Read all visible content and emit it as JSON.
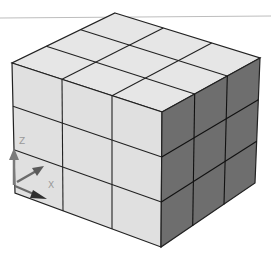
{
  "scene": {
    "description": "Isometric 3x3x3 grid of cubes in a CAD viewport",
    "grid": {
      "cols": 3,
      "rows": 3,
      "layers": 3
    },
    "colors": {
      "background": "#ffffff",
      "top_face": "#e6e6e6",
      "left_face": "#e0e0e0",
      "right_face": "#6e6e6e",
      "edge": "#222222",
      "viewport_line": "#bdbdbd"
    }
  },
  "ucs_icon": {
    "z_label": "Z",
    "x_label": "X",
    "colors": {
      "axis": "#7a7a7a",
      "axis_dark": "#3a3a3a",
      "label": "#9a9a9a"
    }
  }
}
